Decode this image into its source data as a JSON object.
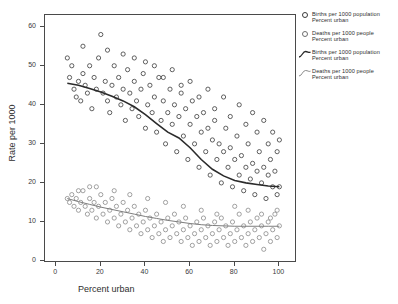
{
  "figure": {
    "top_clipped_label": "",
    "background_color": "#ffffff"
  },
  "axes": {
    "x": {
      "title": "Percent urban",
      "ticks": [
        "0",
        "20",
        "40",
        "60",
        "80",
        "100"
      ],
      "min": -5,
      "max": 107
    },
    "y": {
      "title": "Rate per 1000",
      "ticks": [
        "0",
        "10",
        "20",
        "30",
        "40",
        "50",
        "60"
      ],
      "min": 0,
      "max": 63
    }
  },
  "legend": {
    "entries": [
      {
        "marker": "open-circle-bold",
        "line1": "Births per 1000 population",
        "line2": "Percent urban"
      },
      {
        "marker": "open-circle-thin",
        "line1": "Deaths per 1000 people",
        "line2": "Percent urban"
      },
      {
        "marker": "fit-curve-bold",
        "line1": "Births per 1000 population",
        "line2": "Percent urban"
      },
      {
        "marker": "fit-curve-thin",
        "line1": "Deaths per 1000 people",
        "line2": "Percent urban"
      }
    ]
  },
  "colors": {
    "births_marker": "#3a3a3a",
    "deaths_marker": "#8a8a8a",
    "births_line": "#2b2b2b",
    "deaths_line": "#7d7d7d",
    "axis": "#4a4a4a"
  },
  "chart_data": {
    "type": "scatter",
    "title": "",
    "xlabel": "Percent urban",
    "ylabel": "Rate per 1000",
    "xlim": [
      -5,
      107
    ],
    "ylim": [
      0,
      63
    ],
    "grid": false,
    "legend_position": "right",
    "series": [
      {
        "name": "Births per 1000 population",
        "marker": "open-circle",
        "color": "#3a3a3a",
        "points": [
          [
            5,
            52
          ],
          [
            6,
            47
          ],
          [
            7,
            50
          ],
          [
            8,
            44
          ],
          [
            9,
            42
          ],
          [
            10,
            46
          ],
          [
            11,
            41
          ],
          [
            12,
            48
          ],
          [
            13,
            45
          ],
          [
            14,
            43
          ],
          [
            15,
            50
          ],
          [
            16,
            39
          ],
          [
            17,
            47
          ],
          [
            18,
            44
          ],
          [
            19,
            52
          ],
          [
            20,
            58
          ],
          [
            21,
            43
          ],
          [
            22,
            46
          ],
          [
            23,
            41
          ],
          [
            24,
            38
          ],
          [
            25,
            45
          ],
          [
            26,
            50
          ],
          [
            27,
            42
          ],
          [
            28,
            47
          ],
          [
            29,
            40
          ],
          [
            30,
            44
          ],
          [
            31,
            36
          ],
          [
            32,
            49
          ],
          [
            33,
            43
          ],
          [
            34,
            39
          ],
          [
            35,
            46
          ],
          [
            36,
            41
          ],
          [
            37,
            37
          ],
          [
            38,
            44
          ],
          [
            39,
            48
          ],
          [
            40,
            34
          ],
          [
            41,
            40
          ],
          [
            42,
            45
          ],
          [
            43,
            38
          ],
          [
            44,
            42
          ],
          [
            45,
            33
          ],
          [
            46,
            47
          ],
          [
            47,
            36
          ],
          [
            48,
            41
          ],
          [
            49,
            30
          ],
          [
            50,
            38
          ],
          [
            51,
            44
          ],
          [
            52,
            35
          ],
          [
            53,
            40
          ],
          [
            54,
            28
          ],
          [
            55,
            37
          ],
          [
            56,
            43
          ],
          [
            57,
            32
          ],
          [
            58,
            39
          ],
          [
            59,
            26
          ],
          [
            60,
            35
          ],
          [
            61,
            41
          ],
          [
            62,
            30
          ],
          [
            63,
            37
          ],
          [
            64,
            24
          ],
          [
            65,
            33
          ],
          [
            66,
            38
          ],
          [
            67,
            28
          ],
          [
            68,
            34
          ],
          [
            69,
            22
          ],
          [
            70,
            31
          ],
          [
            71,
            36
          ],
          [
            72,
            26
          ],
          [
            73,
            30
          ],
          [
            74,
            20
          ],
          [
            75,
            28
          ],
          [
            76,
            34
          ],
          [
            77,
            24
          ],
          [
            78,
            29
          ],
          [
            79,
            19
          ],
          [
            80,
            26
          ],
          [
            81,
            32
          ],
          [
            82,
            22
          ],
          [
            83,
            27
          ],
          [
            84,
            18
          ],
          [
            85,
            24
          ],
          [
            86,
            30
          ],
          [
            87,
            21
          ],
          [
            88,
            25
          ],
          [
            89,
            17
          ],
          [
            90,
            23
          ],
          [
            91,
            28
          ],
          [
            92,
            20
          ],
          [
            93,
            24
          ],
          [
            94,
            16
          ],
          [
            95,
            22
          ],
          [
            96,
            26
          ],
          [
            97,
            19
          ],
          [
            98,
            23
          ],
          [
            99,
            17
          ],
          [
            100,
            19
          ],
          [
            12,
            55
          ],
          [
            23,
            54
          ],
          [
            35,
            52
          ],
          [
            44,
            50
          ],
          [
            52,
            49
          ],
          [
            60,
            46
          ],
          [
            68,
            44
          ],
          [
            75,
            42
          ],
          [
            82,
            40
          ],
          [
            88,
            38
          ],
          [
            93,
            36
          ],
          [
            97,
            33
          ],
          [
            100,
            31
          ],
          [
            30,
            53
          ],
          [
            40,
            51
          ],
          [
            48,
            47
          ],
          [
            56,
            45
          ],
          [
            64,
            42
          ],
          [
            71,
            39
          ],
          [
            78,
            37
          ],
          [
            85,
            35
          ],
          [
            90,
            33
          ],
          [
            95,
            30
          ],
          [
            99,
            28
          ]
        ]
      },
      {
        "name": "Deaths per 1000 people",
        "marker": "open-circle",
        "color": "#8a8a8a",
        "points": [
          [
            5,
            16
          ],
          [
            6,
            15
          ],
          [
            7,
            17
          ],
          [
            8,
            14
          ],
          [
            9,
            16
          ],
          [
            10,
            13
          ],
          [
            11,
            15
          ],
          [
            12,
            18
          ],
          [
            13,
            14
          ],
          [
            14,
            12
          ],
          [
            15,
            16
          ],
          [
            16,
            13
          ],
          [
            17,
            15
          ],
          [
            18,
            11
          ],
          [
            19,
            14
          ],
          [
            20,
            17
          ],
          [
            21,
            12
          ],
          [
            22,
            15
          ],
          [
            23,
            10
          ],
          [
            24,
            13
          ],
          [
            25,
            16
          ],
          [
            26,
            11
          ],
          [
            27,
            14
          ],
          [
            28,
            9
          ],
          [
            29,
            12
          ],
          [
            30,
            15
          ],
          [
            31,
            10
          ],
          [
            32,
            13
          ],
          [
            33,
            8
          ],
          [
            34,
            11
          ],
          [
            35,
            14
          ],
          [
            36,
            9
          ],
          [
            37,
            12
          ],
          [
            38,
            7
          ],
          [
            39,
            10
          ],
          [
            40,
            13
          ],
          [
            41,
            8
          ],
          [
            42,
            11
          ],
          [
            43,
            6
          ],
          [
            44,
            9
          ],
          [
            45,
            12
          ],
          [
            46,
            7
          ],
          [
            47,
            10
          ],
          [
            48,
            5
          ],
          [
            49,
            8
          ],
          [
            50,
            11
          ],
          [
            51,
            6
          ],
          [
            52,
            9
          ],
          [
            53,
            12
          ],
          [
            54,
            7
          ],
          [
            55,
            10
          ],
          [
            56,
            5
          ],
          [
            57,
            8
          ],
          [
            58,
            11
          ],
          [
            59,
            6
          ],
          [
            60,
            9
          ],
          [
            61,
            4
          ],
          [
            62,
            7
          ],
          [
            63,
            10
          ],
          [
            64,
            5
          ],
          [
            65,
            8
          ],
          [
            66,
            11
          ],
          [
            67,
            6
          ],
          [
            68,
            9
          ],
          [
            69,
            4
          ],
          [
            70,
            7
          ],
          [
            71,
            10
          ],
          [
            72,
            5
          ],
          [
            73,
            8
          ],
          [
            74,
            11
          ],
          [
            75,
            6
          ],
          [
            76,
            9
          ],
          [
            77,
            4
          ],
          [
            78,
            7
          ],
          [
            79,
            10
          ],
          [
            80,
            5
          ],
          [
            81,
            8
          ],
          [
            82,
            12
          ],
          [
            83,
            6
          ],
          [
            84,
            9
          ],
          [
            85,
            4
          ],
          [
            86,
            7
          ],
          [
            87,
            10
          ],
          [
            88,
            5
          ],
          [
            89,
            8
          ],
          [
            90,
            11
          ],
          [
            91,
            6
          ],
          [
            92,
            9
          ],
          [
            93,
            3
          ],
          [
            94,
            7
          ],
          [
            95,
            10
          ],
          [
            96,
            5
          ],
          [
            97,
            8
          ],
          [
            98,
            12
          ],
          [
            99,
            6
          ],
          [
            100,
            9
          ],
          [
            18,
            19
          ],
          [
            26,
            18
          ],
          [
            33,
            17
          ],
          [
            41,
            16
          ],
          [
            49,
            15
          ],
          [
            57,
            14
          ],
          [
            65,
            13
          ],
          [
            72,
            12
          ],
          [
            80,
            14
          ],
          [
            86,
            13
          ],
          [
            92,
            12
          ],
          [
            96,
            11
          ],
          [
            99,
            13
          ],
          [
            10,
            18
          ],
          [
            15,
            19
          ]
        ]
      }
    ],
    "fits": [
      {
        "name": "Births per 1000 population",
        "type": "lowess",
        "color": "#2b2b2b",
        "width": 1.6,
        "points": [
          [
            5,
            45.5
          ],
          [
            10,
            45.0
          ],
          [
            15,
            44.2
          ],
          [
            20,
            43.3
          ],
          [
            25,
            42.2
          ],
          [
            30,
            41.0
          ],
          [
            35,
            39.5
          ],
          [
            40,
            37.5
          ],
          [
            45,
            35.2
          ],
          [
            50,
            33.0
          ],
          [
            55,
            31.5
          ],
          [
            60,
            29.0
          ],
          [
            65,
            26.0
          ],
          [
            70,
            23.5
          ],
          [
            75,
            21.8
          ],
          [
            80,
            20.6
          ],
          [
            85,
            20.0
          ],
          [
            90,
            19.6
          ],
          [
            95,
            19.2
          ],
          [
            100,
            19.0
          ]
        ]
      },
      {
        "name": "Deaths per 1000 people",
        "type": "lowess",
        "color": "#7d7d7d",
        "width": 1.0,
        "points": [
          [
            5,
            16.0
          ],
          [
            10,
            15.2
          ],
          [
            15,
            14.5
          ],
          [
            20,
            13.8
          ],
          [
            25,
            13.2
          ],
          [
            30,
            12.6
          ],
          [
            35,
            12.0
          ],
          [
            40,
            11.4
          ],
          [
            45,
            10.9
          ],
          [
            50,
            10.4
          ],
          [
            55,
            10.0
          ],
          [
            60,
            9.6
          ],
          [
            65,
            9.3
          ],
          [
            70,
            9.1
          ],
          [
            75,
            9.0
          ],
          [
            80,
            8.9
          ],
          [
            85,
            8.9
          ],
          [
            90,
            8.9
          ],
          [
            95,
            8.9
          ],
          [
            100,
            8.9
          ]
        ]
      }
    ]
  }
}
